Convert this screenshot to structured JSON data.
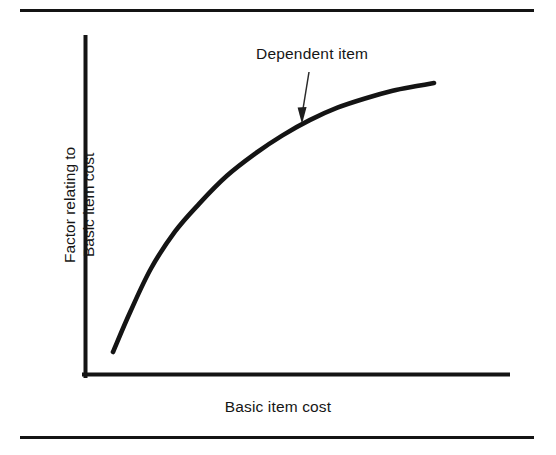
{
  "figure": {
    "background_color": "#ffffff",
    "ink_color": "#141414",
    "top_rule": "horizontal-rule",
    "bottom_rule": "horizontal-rule"
  },
  "annotation": {
    "label": "Dependent item",
    "pointer": "arrow-down-icon"
  },
  "axes": {
    "x_label": "Basic item cost",
    "y_label_line1": "Factor relating to",
    "y_label_line2": "Basic item cost"
  },
  "chart_data": {
    "type": "line",
    "title": "",
    "subtitle": "",
    "xlabel": "Basic item cost",
    "ylabel": "Factor relating to Basic item cost",
    "grid": false,
    "legend_position": "none",
    "xlim": [
      0,
      100
    ],
    "ylim": [
      0,
      100
    ],
    "x_ticks": [],
    "y_ticks": [],
    "annotations": [
      {
        "text": "Dependent item",
        "points_to_x": 52,
        "points_to_y": 76,
        "arrow": "down"
      }
    ],
    "series": [
      {
        "name": "Dependent item cost factor",
        "x": [
          7,
          12,
          18,
          25,
          32,
          40,
          48,
          56,
          64,
          72,
          80,
          88,
          95,
          100
        ],
        "y": [
          8,
          21,
          35,
          47,
          56,
          65,
          72,
          78,
          83,
          87,
          90,
          92.5,
          94,
          95
        ]
      }
    ]
  }
}
